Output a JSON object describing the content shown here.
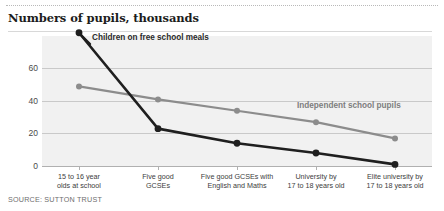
{
  "header": {
    "title": "Numbers of pupils, thousands"
  },
  "footer": {
    "source": "SOURCE: SUTTON TRUST"
  },
  "annotations": {
    "dark_series_label": "Children on free school meals",
    "light_series_label": "Independent school pupils"
  },
  "colors": {
    "dark_series": "#1f1f1f",
    "light_series": "#8c8c8c",
    "plot_background": "#f1f1f1",
    "gridline": "#c9c9c9",
    "title_text": "#1c1c1c",
    "axis_text": "#3c3c3c",
    "source_text": "#6e6e6e"
  },
  "chart_data": {
    "type": "line",
    "title": "Numbers of pupils, thousands",
    "xlabel": "",
    "ylabel": "Numbers of pupils, thousands",
    "ylim": [
      0,
      80
    ],
    "yticks": [
      0,
      20,
      40,
      60
    ],
    "ytick_labels": [
      "0",
      "20",
      "40",
      "60"
    ],
    "grid": true,
    "legend": "annotated-inline",
    "categories": [
      "15 to 16 year olds at school",
      "Five good GCSEs",
      "Five good GCSEs with English and Maths",
      "University by 17 to 18 years old",
      "Elite university by 17 to 18 years old"
    ],
    "category_lines": [
      [
        "15 to 16 year",
        "olds at school"
      ],
      [
        "Five good",
        "GCSEs"
      ],
      [
        "Five good GCSEs with",
        "English and Maths"
      ],
      [
        "University by",
        "17 to 18 years old"
      ],
      [
        "Elite university by",
        "17 to 18 years old"
      ]
    ],
    "series": [
      {
        "name": "Children on free school meals",
        "color": "#1f1f1f",
        "values": [
          82,
          23,
          14,
          8,
          1
        ]
      },
      {
        "name": "Independent school pupils",
        "color": "#8c8c8c",
        "values": [
          49,
          41,
          34,
          27,
          17
        ]
      }
    ]
  }
}
